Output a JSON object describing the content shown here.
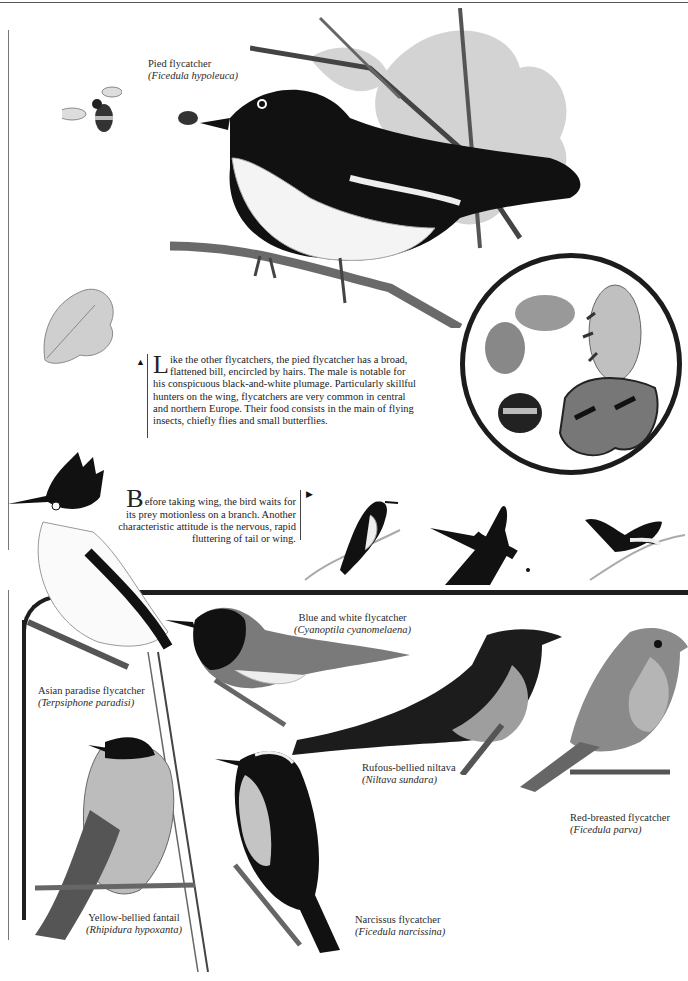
{
  "page": {
    "type": "illustrated field-guide page",
    "theme": "Flycatchers"
  },
  "main_feature": {
    "caption": {
      "common_name": "Pied flycatcher",
      "scientific_name": "(Ficedula hypoleuca)"
    },
    "illustration": "pied-flycatcher-perched-on-oak-branch-with-insect-in-bill",
    "extras": [
      "bee-in-flight",
      "oak-leaves",
      "oak-branch"
    ]
  },
  "insect_inset": {
    "shape": "circle",
    "contents": [
      "beetle",
      "moth",
      "fly",
      "bumblebee",
      "small-tortoiseshell-butterfly"
    ]
  },
  "text_block_1": {
    "marker": "▲",
    "dropcap": "L",
    "text": "ike the other flycatchers, the pied flycatcher has a broad, flattened bill, encircled by hairs. The male is notable for his conspicuous black-and-white plumage. Particularly skillful hunters on the wing, flycatchers are very common in central and northern Europe. Their food consists in the main of flying insects, chiefly flies and small butterflies."
  },
  "text_block_2": {
    "marker": "▶",
    "dropcap": "B",
    "text": "efore taking wing, the bird waits for its prey motionless on a branch. Another characteristic attitude is the nervous, rapid fluttering of tail or wing."
  },
  "behavior_sequence": {
    "figures": [
      "flycatcher-perched-waiting",
      "flycatcher-in-flight-catching-insect",
      "flycatcher-fluttering-tail"
    ]
  },
  "species": [
    {
      "id": "asian-paradise",
      "common_name": "Asian paradise flycatcher",
      "scientific_name": "(Terpsiphone paradisi)"
    },
    {
      "id": "blue-white",
      "common_name": "Blue and white flycatcher",
      "scientific_name": "(Cyanoptila cyanomelaena)"
    },
    {
      "id": "rufous-niltava",
      "common_name": "Rufous-bellied niltava",
      "scientific_name": "(Niltava sundara)"
    },
    {
      "id": "red-breasted",
      "common_name": "Red-breasted flycatcher",
      "scientific_name": "(Ficedula parva)"
    },
    {
      "id": "yellow-fantail",
      "common_name": "Yellow-bellied fantail",
      "scientific_name": "(Rhipidura hypoxanta)"
    },
    {
      "id": "narcissus",
      "common_name": "Narcissus flycatcher",
      "scientific_name": "(Ficedula narcissina)"
    }
  ],
  "colors": {
    "ink": "#1a1a1a",
    "rule": "#1e1e1e",
    "paper": "#ffffff",
    "plumage_gray": "#9a9a9a"
  }
}
